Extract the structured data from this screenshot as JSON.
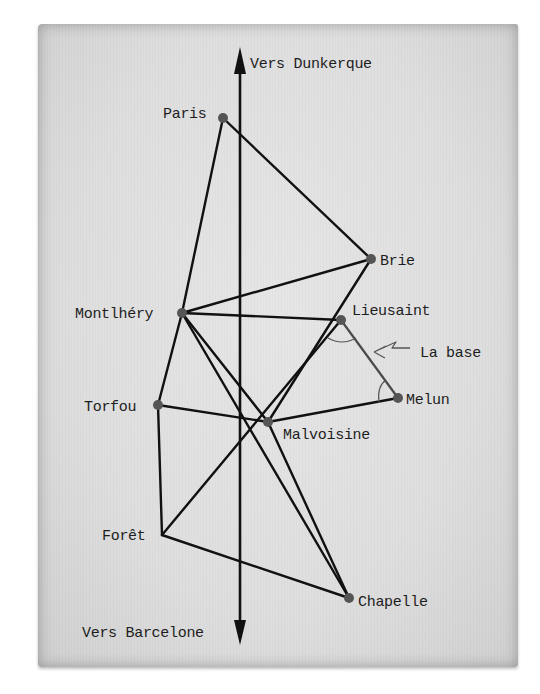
{
  "diagram": {
    "colors": {
      "paper": "#dedede",
      "line": "#111111",
      "base_line": "#4a4a4a",
      "node": "#555555",
      "text": "#1d1d1d"
    },
    "axis": {
      "top_label": "Vers Dunkerque",
      "bottom_label": "Vers Barcelone",
      "x": 240,
      "y_top": 47,
      "y_bottom": 645
    },
    "nodes": [
      {
        "id": "paris",
        "label": "Paris",
        "x": 223,
        "y": 118,
        "dot": true
      },
      {
        "id": "brie",
        "label": "Brie",
        "x": 371,
        "y": 259,
        "dot": true
      },
      {
        "id": "montlhery",
        "label": "Montlhéry",
        "x": 182,
        "y": 313,
        "dot": true
      },
      {
        "id": "lieusaint",
        "label": "Lieusaint",
        "x": 341,
        "y": 320,
        "dot": true
      },
      {
        "id": "melun",
        "label": "Melun",
        "x": 398,
        "y": 398,
        "dot": true
      },
      {
        "id": "torfou",
        "label": "Torfou",
        "x": 158,
        "y": 405,
        "dot": true
      },
      {
        "id": "malvoisine",
        "label": "Malvoisine",
        "x": 268,
        "y": 422,
        "dot": true
      },
      {
        "id": "foret",
        "label": "Forêt",
        "x": 162,
        "y": 535,
        "dot": false
      },
      {
        "id": "chapelle",
        "label": "Chapelle",
        "x": 349,
        "y": 598,
        "dot": true
      }
    ],
    "edges": [
      [
        "paris",
        "brie"
      ],
      [
        "paris",
        "montlhery"
      ],
      [
        "brie",
        "montlhery"
      ],
      [
        "brie",
        "malvoisine"
      ],
      [
        "montlhery",
        "lieusaint"
      ],
      [
        "montlhery",
        "malvoisine"
      ],
      [
        "montlhery",
        "torfou"
      ],
      [
        "montlhery",
        "chapelle"
      ],
      [
        "lieusaint",
        "foret"
      ],
      [
        "malvoisine",
        "melun"
      ],
      [
        "torfou",
        "malvoisine"
      ],
      [
        "torfou",
        "foret"
      ],
      [
        "foret",
        "chapelle"
      ],
      [
        "malvoisine",
        "chapelle"
      ]
    ],
    "base": {
      "from": "lieusaint",
      "to": "melun",
      "label": "La base",
      "arrow_icon": "zigzag-arrow-icon"
    }
  }
}
